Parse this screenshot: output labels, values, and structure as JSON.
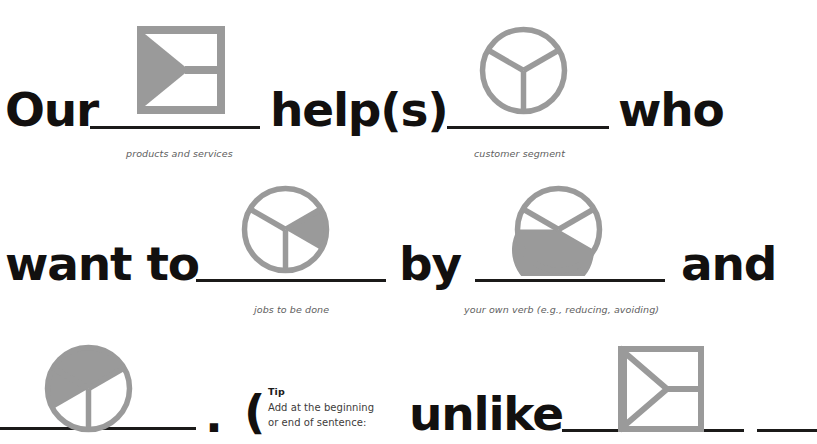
{
  "accent_gray": "#9a9a9a",
  "ink": "#12100f",
  "hint_color": "#5e5e5e",
  "sentence": {
    "w1": "Our",
    "w2": "help(s)",
    "w3": "who",
    "w4": "want to",
    "w5": "by",
    "w6": "and",
    "w7": "unlike"
  },
  "punctuation": {
    "period": ".",
    "open_paren": "("
  },
  "hints": {
    "products_services": "products and services",
    "customer_segment": "customer segment",
    "jobs_to_be_done": "jobs to be done",
    "own_verb": "your own verb (e.g., reducing, avoiding)"
  },
  "tip": {
    "title": "Tip",
    "line1": "Add at the beginning",
    "line2": "or end of sentence:"
  },
  "icons": {
    "square_filled": "square-arrow-filled-icon",
    "circle_empty": "circle-thirds-empty-icon",
    "circle_one_third": "circle-thirds-one-filled-icon",
    "circle_two_thirds": "circle-thirds-two-filled-icon",
    "circle_top_third": "circle-thirds-top-filled-icon",
    "square_outline": "square-arrow-outline-icon"
  }
}
